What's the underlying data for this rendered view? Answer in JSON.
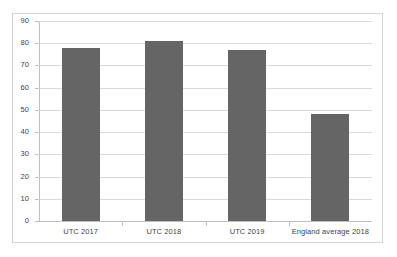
{
  "chart_data": {
    "type": "bar",
    "title": "",
    "subtitle": "",
    "xlabel": "",
    "ylabel": "",
    "categories": [
      "UTC 2017",
      "UTC 2018",
      "UTC 2019",
      "England average 2018"
    ],
    "values": [
      78,
      81,
      77,
      48
    ],
    "series": [
      {
        "name": "",
        "values": [
          78,
          81,
          77,
          48
        ]
      }
    ],
    "ylim": [
      0,
      90
    ],
    "ytick_step": 10,
    "yticks": [
      90,
      80,
      70,
      60,
      50,
      40,
      30,
      20,
      10,
      0
    ],
    "ytick_labels": [
      "90",
      "80",
      "70",
      "60",
      "50",
      "40",
      "30",
      "20",
      "10",
      "0"
    ],
    "grid": true,
    "grid_axis": "y",
    "legend": false,
    "legend_position": "none",
    "annotations": [],
    "colors": {
      "bar": "#656565",
      "gridline": "#d9d9d9",
      "axis": "#bfbfbf",
      "border": "#d4d4d4",
      "background": "#ffffff",
      "text": "#3f3f3f"
    }
  }
}
